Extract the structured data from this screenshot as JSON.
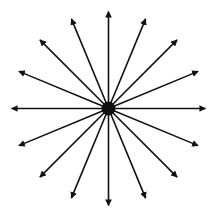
{
  "diagram": {
    "type": "radial-arrows",
    "arrow_count": 16,
    "center": {
      "x": 108.5,
      "y": 108.5
    },
    "center_dot_radius": 7,
    "arrow_length": 97,
    "angles_deg": [
      0,
      22.5,
      45,
      67.5,
      90,
      112.5,
      135,
      157.5,
      180,
      202.5,
      225,
      247.5,
      270,
      292.5,
      315,
      337.5
    ],
    "colors": {
      "line": "#111111",
      "background": "#ffffff"
    }
  }
}
